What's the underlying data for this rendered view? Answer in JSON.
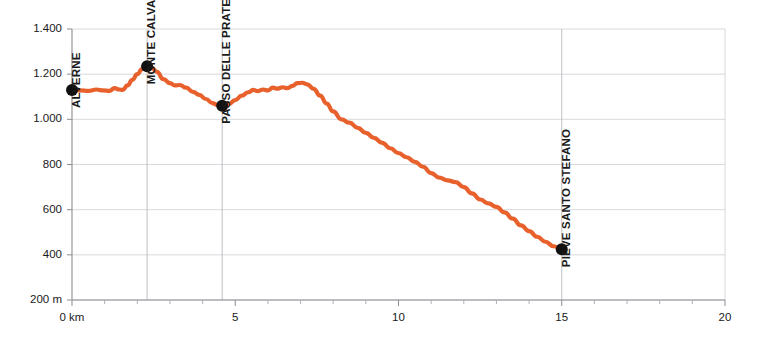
{
  "chart_data": {
    "type": "line",
    "title": "",
    "subtitle": "",
    "xlabel": "",
    "ylabel": "",
    "xlim": [
      0,
      20
    ],
    "ylim": [
      200,
      1400
    ],
    "grid": true,
    "legend_position": "none",
    "x_unit": "km",
    "y_unit": "m",
    "x_tick_labels": [
      "0 km",
      "5",
      "10",
      "15",
      "20"
    ],
    "x_tick_values": [
      0,
      5,
      10,
      15,
      20
    ],
    "x_minor_tick_values": [
      1,
      2,
      3,
      4,
      6,
      7,
      8,
      9,
      11,
      12,
      13,
      14,
      16,
      17,
      18,
      19
    ],
    "y_tick_labels": [
      "1.400",
      "1.200",
      "1.000",
      "800",
      "600",
      "400",
      "200 m"
    ],
    "y_tick_values": [
      1400,
      1200,
      1000,
      800,
      600,
      400,
      200
    ],
    "series": [
      {
        "name": "elevation",
        "color": "#E8602C",
        "x": [
          0.0,
          0.25,
          0.5,
          0.75,
          0.95,
          1.15,
          1.3,
          1.45,
          1.55,
          1.7,
          1.85,
          2.0,
          2.15,
          2.3,
          2.45,
          2.6,
          2.8,
          3.0,
          3.15,
          3.3,
          3.5,
          3.7,
          3.9,
          4.1,
          4.3,
          4.45,
          4.6,
          4.8,
          5.0,
          5.2,
          5.4,
          5.55,
          5.7,
          5.85,
          6.0,
          6.15,
          6.3,
          6.45,
          6.6,
          6.75,
          6.9,
          7.05,
          7.2,
          7.4,
          7.6,
          7.8,
          8.0,
          8.25,
          8.5,
          8.75,
          9.0,
          9.25,
          9.5,
          9.75,
          10.0,
          10.25,
          10.5,
          10.75,
          11.0,
          11.25,
          11.5,
          11.75,
          12.0,
          12.25,
          12.5,
          12.75,
          13.0,
          13.25,
          13.5,
          13.75,
          14.0,
          14.25,
          14.5,
          14.75,
          15.0
        ],
        "y": [
          1130,
          1128,
          1126,
          1132,
          1128,
          1126,
          1138,
          1132,
          1130,
          1150,
          1175,
          1200,
          1222,
          1235,
          1228,
          1210,
          1178,
          1160,
          1150,
          1152,
          1140,
          1122,
          1108,
          1090,
          1072,
          1064,
          1060,
          1068,
          1085,
          1105,
          1120,
          1130,
          1125,
          1132,
          1128,
          1140,
          1136,
          1142,
          1138,
          1148,
          1160,
          1162,
          1155,
          1135,
          1105,
          1070,
          1035,
          1000,
          985,
          962,
          940,
          918,
          896,
          872,
          850,
          832,
          812,
          790,
          762,
          742,
          730,
          722,
          700,
          672,
          645,
          628,
          612,
          588,
          560,
          530,
          505,
          480,
          458,
          438,
          425
        ]
      }
    ],
    "annotations": [
      {
        "label": "ALVERNE",
        "x": 0.0,
        "y": 1130
      },
      {
        "label": "MONTE CALVANO",
        "x": 2.3,
        "y": 1235
      },
      {
        "label": "PASSO DELLE PRATELLE",
        "x": 4.6,
        "y": 1060
      },
      {
        "label": "PIEVE SANTO STEFANO",
        "x": 15.0,
        "y": 425
      }
    ]
  },
  "colors": {
    "line": "#E8602C",
    "marker": "#111111",
    "grid": "#cfcfd4",
    "axis": "#8d8d93",
    "background": "#ffffff"
  }
}
